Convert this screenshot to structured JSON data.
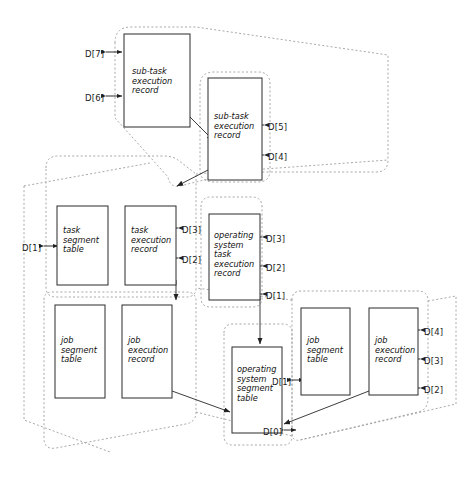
{
  "diagram": {
    "colors": {
      "box_stroke": "#2b2b2b",
      "solid_line": "#333333",
      "dashed_line": "#9a9a9a",
      "text": "#111111",
      "background": "#ffffff"
    },
    "boxes": [
      {
        "id": "subtask_exec_1",
        "label": "sub-task\nexecution\nrecord",
        "x": 124,
        "y": 34,
        "w": 66,
        "h": 93,
        "tx": 132,
        "ty": 67
      },
      {
        "id": "subtask_exec_2",
        "label": "sub-task\nexecution\nrecord",
        "x": 208,
        "y": 78,
        "w": 54,
        "h": 102,
        "tx": 214,
        "ty": 112
      },
      {
        "id": "task_segment_table",
        "label": "task\nsegment\ntable",
        "x": 57,
        "y": 206,
        "w": 51,
        "h": 79,
        "tx": 63,
        "ty": 226
      },
      {
        "id": "task_exec_record",
        "label": "task\nexecution\nrecord",
        "x": 125,
        "y": 206,
        "w": 51,
        "h": 79,
        "tx": 131,
        "ty": 226
      },
      {
        "id": "os_task_exec_record",
        "label": "operating\nsystem\ntask\nexecution\nrecord",
        "x": 209,
        "y": 214,
        "w": 51,
        "h": 86,
        "tx": 214,
        "ty": 231
      },
      {
        "id": "job_segment_table_left",
        "label": "job\nsegment\ntable",
        "x": 55,
        "y": 305,
        "w": 50,
        "h": 93,
        "tx": 61,
        "ty": 336
      },
      {
        "id": "job_exec_record_left",
        "label": "job\nexecution\nrecord",
        "x": 122,
        "y": 305,
        "w": 50,
        "h": 93,
        "tx": 128,
        "ty": 336
      },
      {
        "id": "os_segment_table",
        "label": "operating\nsystem\nsegment\ntable",
        "x": 232,
        "y": 347,
        "w": 50,
        "h": 86,
        "tx": 237,
        "ty": 365
      },
      {
        "id": "job_segment_table_right",
        "label": "job\nsegment\ntable",
        "x": 301,
        "y": 308,
        "w": 49,
        "h": 87,
        "tx": 307,
        "ty": 336
      },
      {
        "id": "job_exec_record_right",
        "label": "job\nexecution\nrecord",
        "x": 369,
        "y": 308,
        "w": 49,
        "h": 87,
        "tx": 375,
        "ty": 336
      }
    ],
    "port_labels": [
      {
        "id": "p_d7",
        "text": "D[7]",
        "x": 85,
        "y": 49
      },
      {
        "id": "p_d6",
        "text": "D[6]",
        "x": 85,
        "y": 93
      },
      {
        "id": "p_d5",
        "text": "D[5]",
        "x": 268,
        "y": 122
      },
      {
        "id": "p_d4_top",
        "text": "D[4]",
        "x": 268,
        "y": 152
      },
      {
        "id": "p_d1_left",
        "text": "D[1]",
        "x": 22,
        "y": 243
      },
      {
        "id": "p_d3_task",
        "text": "D[3]",
        "x": 182,
        "y": 225
      },
      {
        "id": "p_d2_task",
        "text": "D[2]",
        "x": 182,
        "y": 255
      },
      {
        "id": "p_d3_os",
        "text": "D[3]",
        "x": 266,
        "y": 234
      },
      {
        "id": "p_d2_os",
        "text": "D[2]",
        "x": 266,
        "y": 263
      },
      {
        "id": "p_d1_os",
        "text": "D[1]",
        "x": 266,
        "y": 291
      },
      {
        "id": "p_d1_jobseg",
        "text": "D[1]",
        "x": 272,
        "y": 377
      },
      {
        "id": "p_d0",
        "text": "D[0]",
        "x": 263,
        "y": 427
      },
      {
        "id": "p_d4_job",
        "text": "D[4]",
        "x": 424,
        "y": 327
      },
      {
        "id": "p_d3_job",
        "text": "D[3]",
        "x": 424,
        "y": 356
      },
      {
        "id": "p_d2_job",
        "text": "D[2]",
        "x": 424,
        "y": 385
      }
    ]
  }
}
